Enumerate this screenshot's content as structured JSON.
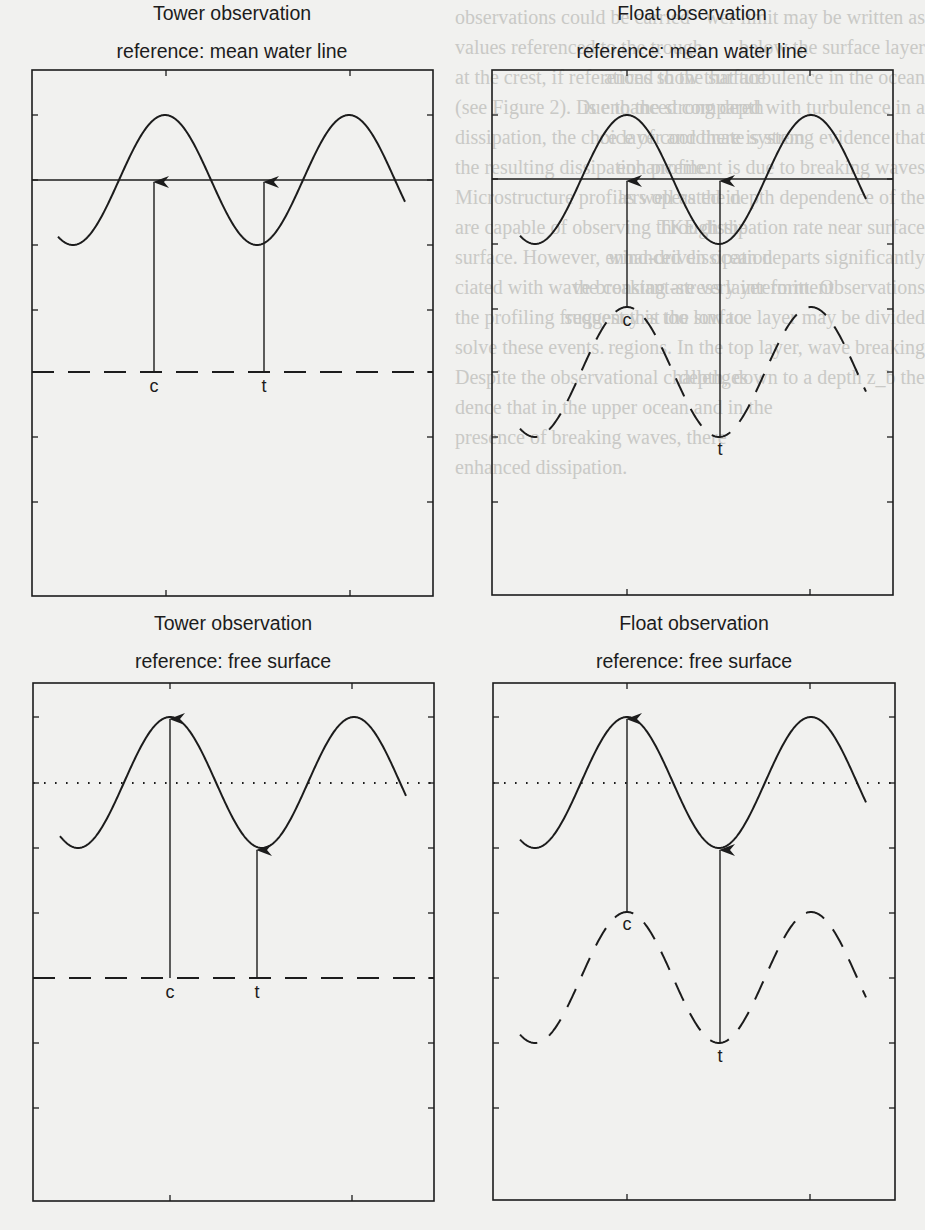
{
  "figure": {
    "panels": [
      {
        "id": "tower-mwl",
        "title_line1": "Tower observation",
        "title_line2": "reference: mean water line",
        "box": {
          "x0": 32,
          "y0": 70,
          "x1": 433,
          "y1": 596
        },
        "reference_line": {
          "style": "solid",
          "y": 180
        },
        "instrument_line": {
          "style": "dashed",
          "type": "flat",
          "y": 372
        },
        "surface": {
          "crest_y": 115,
          "trough_y": 245,
          "crest_x": 165,
          "x_start": 58,
          "x_end": 405
        },
        "arrows": [
          {
            "label": "c",
            "x": 154,
            "from_y": 372,
            "to_y": 180,
            "label_y": 392
          },
          {
            "label": "t",
            "x": 264,
            "from_y": 372,
            "to_y": 180,
            "label_y": 392
          }
        ],
        "yticks": [
          115,
          180,
          245,
          310,
          372,
          437,
          502
        ],
        "xticks": [
          166,
          350
        ]
      },
      {
        "id": "float-mwl",
        "title_line1": "Float observation",
        "title_line2": "reference: mean water line",
        "box": {
          "x0": 492,
          "y0": 70,
          "x1": 893,
          "y1": 595
        },
        "reference_line": {
          "style": "solid",
          "y": 179
        },
        "instrument_line": {
          "style": "dashed",
          "type": "sine",
          "crest_y": 307,
          "trough_y": 437
        },
        "surface": {
          "crest_y": 115,
          "trough_y": 244,
          "crest_x": 627,
          "x_start": 520,
          "x_end": 866
        },
        "arrows": [
          {
            "label": "c",
            "x": 627,
            "from_y": 308,
            "to_y": 179,
            "label_y": 326
          },
          {
            "label": "t",
            "x": 720,
            "from_y": 437,
            "to_y": 179,
            "label_y": 455
          }
        ],
        "yticks": [
          115,
          179,
          244,
          309,
          372,
          437,
          502
        ],
        "xticks": [
          627,
          810
        ]
      },
      {
        "id": "tower-fs",
        "title_line1": "Tower observation",
        "title_line2": "reference: free surface",
        "box": {
          "x0": 33,
          "y0": 683,
          "x1": 434,
          "y1": 1201
        },
        "reference_line": {
          "style": "dotted",
          "y": 783
        },
        "instrument_line": {
          "style": "dashed",
          "type": "flat",
          "y": 978
        },
        "surface": {
          "crest_y": 717,
          "trough_y": 848,
          "crest_x": 170,
          "x_start": 60,
          "x_end": 406
        },
        "arrows": [
          {
            "label": "c",
            "x": 170,
            "from_y": 978,
            "to_y": 717,
            "label_y": 998
          },
          {
            "label": "t",
            "x": 257,
            "from_y": 978,
            "to_y": 848,
            "label_y": 998
          }
        ],
        "yticks": [
          717,
          783,
          848,
          913,
          978,
          1043,
          1108
        ],
        "xticks": [
          170,
          352
        ]
      },
      {
        "id": "float-fs",
        "title_line1": "Float observation",
        "title_line2": "reference: free surface",
        "box": {
          "x0": 493,
          "y0": 683,
          "x1": 895,
          "y1": 1200
        },
        "reference_line": {
          "style": "dotted",
          "y": 783
        },
        "instrument_line": {
          "style": "dashed",
          "type": "sine",
          "crest_y": 912,
          "trough_y": 1043
        },
        "surface": {
          "crest_y": 717,
          "trough_y": 848,
          "crest_x": 627,
          "x_start": 520,
          "x_end": 866
        },
        "arrows": [
          {
            "label": "c",
            "x": 627,
            "from_y": 912,
            "to_y": 717,
            "label_y": 930
          },
          {
            "label": "t",
            "x": 720,
            "from_y": 1043,
            "to_y": 848,
            "label_y": 1062
          }
        ],
        "yticks": [
          717,
          783,
          848,
          913,
          978,
          1043,
          1108
        ],
        "xticks": [
          627,
          810
        ]
      }
    ],
    "wavelength_px": 184,
    "colors": {
      "ink": "#1c1c1c",
      "paper": "#f1f1ef",
      "bleed_text": "#c9c9c6"
    }
  },
  "bleed_text": {
    "left_column_x": 455,
    "right_column_x": 0,
    "lines_left": [
      {
        "y": 24,
        "text": "observations could be carried"
      },
      {
        "y": 54,
        "text": "values referenced to the trough"
      },
      {
        "y": 84,
        "text": "at the crest, if referenced to the surface"
      },
      {
        "y": 114,
        "text": "(see Figure 2). Due to the strong depth"
      },
      {
        "y": 144,
        "text": "dissipation, the choice of coordinate system"
      },
      {
        "y": 174,
        "text": "the resulting dissipation profile."
      },
      {
        "y": 204,
        "text": "Microstructure profilers operated in"
      },
      {
        "y": 234,
        "text": "are capable of observing through the"
      },
      {
        "y": 264,
        "text": "surface. However, enhanced dissipation"
      },
      {
        "y": 294,
        "text": "ciated with wave breaking are very intermittent"
      },
      {
        "y": 324,
        "text": "the profiling frequency is too low to"
      },
      {
        "y": 354,
        "text": "solve these events."
      },
      {
        "y": 384,
        "text": "Despite the observational challenges"
      },
      {
        "y": 414,
        "text": "dence that in the upper ocean and in the"
      },
      {
        "y": 444,
        "text": "presence of breaking waves, there"
      },
      {
        "y": 474,
        "text": "enhanced dissipation."
      }
    ],
    "lines_right": [
      {
        "y": 24,
        "text": "wer limit may be written as"
      },
      {
        "y": 54,
        "text": "below the surface layer"
      },
      {
        "y": 84,
        "text": "ations show that turbulence in the ocean"
      },
      {
        "y": 114,
        "text": "is enhanced compared with turbulence in a"
      },
      {
        "y": 144,
        "text": "ce layer and there is strong evidence that"
      },
      {
        "y": 174,
        "text": "enhancement is due to breaking waves"
      },
      {
        "y": 204,
        "text": "as well as the depth dependence of the"
      },
      {
        "y": 234,
        "text": "TKE dissipation rate near surface"
      },
      {
        "y": 264,
        "text": "wind-driven ocean departs significantly"
      },
      {
        "y": 294,
        "text": "the constant-stress layer form. Observations"
      },
      {
        "y": 324,
        "text": "suggest that the surface layer may be divided"
      },
      {
        "y": 354,
        "text": "regions. In the top layer, wave breaking"
      },
      {
        "y": 384,
        "text": "depth, down to a depth z_b the"
      }
    ]
  }
}
